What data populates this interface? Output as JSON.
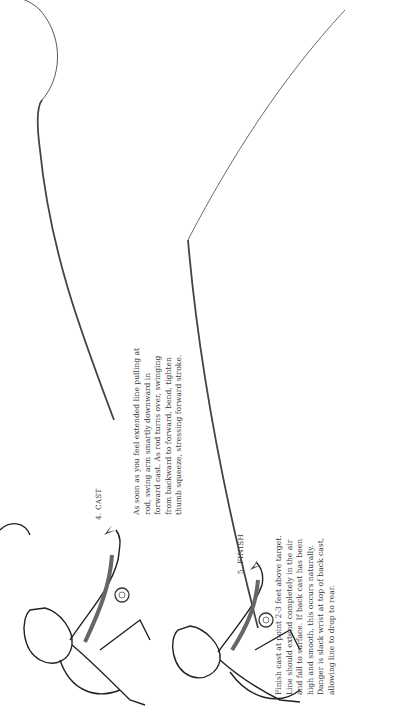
{
  "steps": [
    {
      "label": "4.  CAST",
      "lines": [
        "As soon as you feel extended line pulling at",
        "rod, swing arm smartly downward in",
        "forward cast. As rod turns over, swinging",
        "from backward to forward, bend, tighten",
        "thumb squeeze, stressing forward stroke."
      ]
    },
    {
      "label": "5.  FINISH",
      "lines": [
        "Finish cast at point 2-3 feet above target.",
        "Line should extend completely in the air",
        "and fall to surface. If back cast has been",
        "high and smooth, this occurs naturally.",
        "Danger is slack wrist at top of back cast,",
        "allowing line to drop to rear."
      ]
    }
  ]
}
